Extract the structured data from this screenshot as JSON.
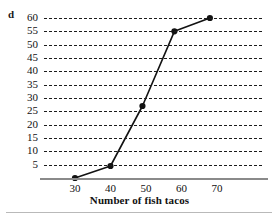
{
  "part_label": "d",
  "chart_data": {
    "type": "line",
    "title": "",
    "xlabel": "Number of fish tacos",
    "ylabel": "",
    "x": [
      30,
      40,
      49,
      58,
      68
    ],
    "values": [
      0,
      4.5,
      27,
      55,
      60
    ],
    "points": [
      {
        "x": 30,
        "y": 0
      },
      {
        "x": 40,
        "y": 4.5
      },
      {
        "x": 49,
        "y": 27
      },
      {
        "x": 58,
        "y": 55
      },
      {
        "x": 68,
        "y": 60
      }
    ],
    "xlim": [
      25,
      75
    ],
    "ylim": [
      0,
      62
    ],
    "xticks": [
      30,
      40,
      50,
      60,
      70
    ],
    "yticks": [
      5,
      10,
      15,
      20,
      25,
      30,
      35,
      40,
      45,
      50,
      55,
      60
    ],
    "xtick_labels": [
      "30",
      "40",
      "50",
      "60",
      "70"
    ],
    "ytick_labels": [
      "60",
      "55",
      "50",
      "45",
      "40",
      "35",
      "30",
      "25",
      "20",
      "15",
      "10",
      "5"
    ],
    "grid": "horizontal-dashed",
    "legend": "none",
    "series": [
      {
        "name": "fish tacos",
        "marker": "filled-circle",
        "line_color": "#121212",
        "values": [
          0,
          4.5,
          27,
          55,
          60
        ]
      }
    ],
    "colors": {
      "line": "#121212",
      "marker": "#121212",
      "grid": "#1c1c1c",
      "axis": "#8a8a8a",
      "text": "#111111",
      "background": "#ffffff"
    }
  }
}
